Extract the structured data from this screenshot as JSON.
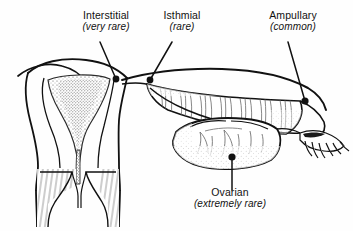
{
  "figure": {
    "name": "ectopic-pregnancy-implantation-sites",
    "background_color": "#fefefe",
    "ink_color": "#111111",
    "width": 353,
    "height": 231
  },
  "labels": {
    "interstitial": {
      "title": "Interstitial",
      "frequency": "(very rare)"
    },
    "isthmial": {
      "title": "Isthmial",
      "frequency": "(rare)"
    },
    "ampullary": {
      "title": "Ampullary",
      "frequency": "(common)"
    },
    "ovarian": {
      "title": "Ovarian",
      "frequency": "(extremely rare)"
    }
  },
  "anatomy": {
    "structures": [
      "uterus",
      "endometrial-cavity",
      "cervix",
      "vaginal-fornix",
      "broad-ligament",
      "fallopian-tube",
      "ampulla",
      "fimbriae",
      "ovary"
    ]
  },
  "leader_points": {
    "interstitial": {
      "x": 116,
      "y": 79
    },
    "isthmial": {
      "x": 150,
      "y": 80
    },
    "ampullary": {
      "x": 305,
      "y": 101
    },
    "ovarian": {
      "x": 232,
      "y": 157
    }
  }
}
